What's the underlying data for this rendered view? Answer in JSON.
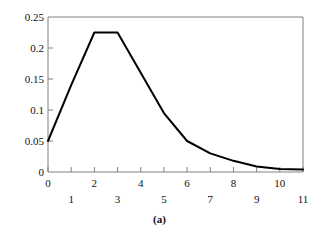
{
  "caption": "(a)",
  "chart_data": {
    "type": "line",
    "title": "",
    "xlabel": "",
    "ylabel": "",
    "xlim": [
      0,
      11
    ],
    "ylim": [
      0,
      0.25
    ],
    "grid": false,
    "legend": null,
    "line_color": "#000000",
    "axis_color": "#808080",
    "x_ticks": [
      0,
      1,
      2,
      3,
      4,
      5,
      6,
      7,
      8,
      9,
      10,
      11
    ],
    "x_tick_labels": [
      "0",
      "1",
      "2",
      "3",
      "4",
      "5",
      "6",
      "7",
      "8",
      "9",
      "10",
      "11"
    ],
    "y_ticks": [
      0,
      0.05,
      0.1,
      0.15,
      0.2,
      0.25
    ],
    "y_tick_labels": [
      "0",
      "0.05",
      "0.1",
      "0.15",
      "0.2",
      "0.25"
    ],
    "x": [
      0,
      1,
      2,
      3,
      4,
      5,
      6,
      7,
      8,
      9,
      10,
      11
    ],
    "values": [
      0.05,
      0.14,
      0.225,
      0.225,
      0.16,
      0.095,
      0.05,
      0.03,
      0.018,
      0.009,
      0.005,
      0.004
    ],
    "series": [
      {
        "name": "distribution",
        "values": [
          0.05,
          0.14,
          0.225,
          0.225,
          0.16,
          0.095,
          0.05,
          0.03,
          0.018,
          0.009,
          0.005,
          0.004
        ]
      }
    ]
  }
}
